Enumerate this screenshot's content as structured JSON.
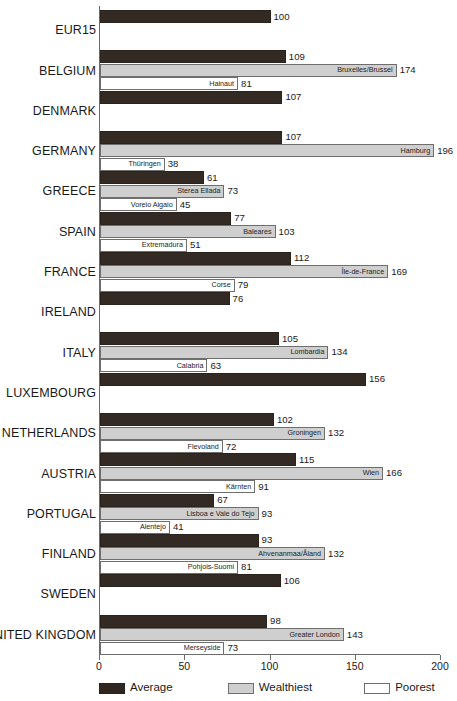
{
  "chart_data": {
    "type": "bar",
    "orientation": "horizontal",
    "title": "",
    "subtitle": "",
    "xlabel": "",
    "ylabel": "",
    "xlim": [
      0,
      200
    ],
    "xticks": [
      0,
      50,
      100,
      150,
      200
    ],
    "xtick_labels": [
      "0",
      "50",
      "100",
      "150",
      "200"
    ],
    "grid": false,
    "legend_position": "bottom",
    "series_names": [
      "Average",
      "Wealthiest",
      "Poorest"
    ],
    "categories": [
      "EUR15",
      "BELGIUM",
      "DENMARK",
      "GERMANY",
      "GREECE",
      "SPAIN",
      "FRANCE",
      "IRELAND",
      "ITALY",
      "LUXEMBOURG",
      "NETHERLANDS",
      "AUSTRIA",
      "PORTUGAL",
      "FINLAND",
      "SWEDEN",
      "UNITED KINGDOM"
    ],
    "groups": [
      {
        "country": "EUR15",
        "bars": [
          {
            "series": "Average",
            "value": 100,
            "region": ""
          }
        ]
      },
      {
        "country": "BELGIUM",
        "bars": [
          {
            "series": "Average",
            "value": 109,
            "region": ""
          },
          {
            "series": "Wealthiest",
            "value": 174,
            "region": "Bruxelles/Brussel"
          },
          {
            "series": "Poorest",
            "value": 81,
            "region": "Hainaut"
          }
        ]
      },
      {
        "country": "DENMARK",
        "bars": [
          {
            "series": "Average",
            "value": 107,
            "region": ""
          }
        ]
      },
      {
        "country": "GERMANY",
        "bars": [
          {
            "series": "Average",
            "value": 107,
            "region": ""
          },
          {
            "series": "Wealthiest",
            "value": 196,
            "region": "Hamburg"
          },
          {
            "series": "Poorest",
            "value": 38,
            "region": "Thüringen"
          }
        ]
      },
      {
        "country": "GREECE",
        "bars": [
          {
            "series": "Average",
            "value": 61,
            "region": ""
          },
          {
            "series": "Wealthiest",
            "value": 73,
            "region": "Sterea Ellada"
          },
          {
            "series": "Poorest",
            "value": 45,
            "region": "Voreio Aigaio"
          }
        ]
      },
      {
        "country": "SPAIN",
        "bars": [
          {
            "series": "Average",
            "value": 77,
            "region": ""
          },
          {
            "series": "Wealthiest",
            "value": 103,
            "region": "Baleares"
          },
          {
            "series": "Poorest",
            "value": 51,
            "region": "Extremadura"
          }
        ]
      },
      {
        "country": "FRANCE",
        "bars": [
          {
            "series": "Average",
            "value": 112,
            "region": ""
          },
          {
            "series": "Wealthiest",
            "value": 169,
            "region": "Île-de-France"
          },
          {
            "series": "Poorest",
            "value": 79,
            "region": "Corse"
          }
        ]
      },
      {
        "country": "IRELAND",
        "bars": [
          {
            "series": "Average",
            "value": 76,
            "region": ""
          }
        ]
      },
      {
        "country": "ITALY",
        "bars": [
          {
            "series": "Average",
            "value": 105,
            "region": ""
          },
          {
            "series": "Wealthiest",
            "value": 134,
            "region": "Lombardia"
          },
          {
            "series": "Poorest",
            "value": 63,
            "region": "Calabria"
          }
        ]
      },
      {
        "country": "LUXEMBOURG",
        "bars": [
          {
            "series": "Average",
            "value": 156,
            "region": ""
          }
        ]
      },
      {
        "country": "NETHERLANDS",
        "bars": [
          {
            "series": "Average",
            "value": 102,
            "region": ""
          },
          {
            "series": "Wealthiest",
            "value": 132,
            "region": "Groningen"
          },
          {
            "series": "Poorest",
            "value": 72,
            "region": "Flevoland"
          }
        ]
      },
      {
        "country": "AUSTRIA",
        "bars": [
          {
            "series": "Average",
            "value": 115,
            "region": ""
          },
          {
            "series": "Wealthiest",
            "value": 166,
            "region": "Wien"
          },
          {
            "series": "Poorest",
            "value": 91,
            "region": "Kärnten"
          }
        ]
      },
      {
        "country": "PORTUGAL",
        "bars": [
          {
            "series": "Average",
            "value": 67,
            "region": ""
          },
          {
            "series": "Wealthiest",
            "value": 93,
            "region": "Lisboa e Vale do Tejo"
          },
          {
            "series": "Poorest",
            "value": 41,
            "region": "Alentejo"
          }
        ]
      },
      {
        "country": "FINLAND",
        "bars": [
          {
            "series": "Average",
            "value": 93,
            "region": ""
          },
          {
            "series": "Wealthiest",
            "value": 132,
            "region": "Ahvenanmaa/Åland"
          },
          {
            "series": "Poorest",
            "value": 81,
            "region": "Pohjois-Suomi"
          }
        ]
      },
      {
        "country": "SWEDEN",
        "bars": [
          {
            "series": "Average",
            "value": 106,
            "region": ""
          }
        ]
      },
      {
        "country": "UNITED KINGDOM",
        "bars": [
          {
            "series": "Average",
            "value": 98,
            "region": ""
          },
          {
            "series": "Wealthiest",
            "value": 143,
            "region": "Greater London"
          },
          {
            "series": "Poorest",
            "value": 73,
            "region": "Merseyside"
          }
        ]
      }
    ]
  },
  "legend": {
    "items": [
      {
        "label": "Average",
        "swatch": "average",
        "color": "#2e261f"
      },
      {
        "label": "Wealthiest",
        "swatch": "wealthiest",
        "color": "#cfcfcf"
      },
      {
        "label": "Poorest",
        "swatch": "poorest",
        "color": "#ffffff"
      }
    ]
  },
  "colors": {
    "average": "#2e261f",
    "wealthiest": "#cfcfcf",
    "poorest": "#ffffff",
    "axis": "#6b6b6b",
    "text": "#1a1a1a"
  }
}
